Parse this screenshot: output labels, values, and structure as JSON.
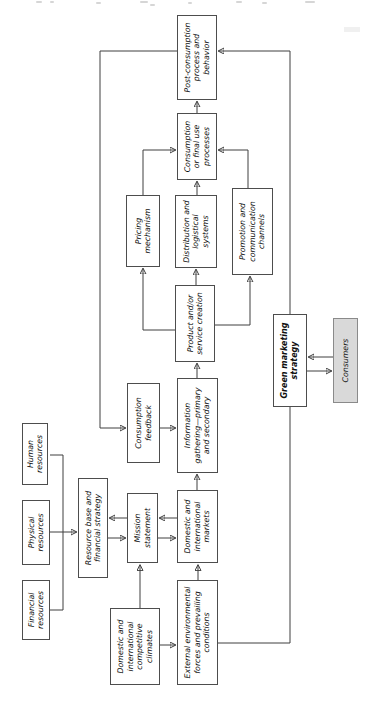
{
  "diagram": {
    "title_note": "",
    "colors": {
      "box_border": "#4d4d4d",
      "line": "#3f3f3f",
      "text": "#101010",
      "consumers_fill": "#d9d9d9",
      "background": "#ffffff"
    },
    "nodes": {
      "financial_resources": {
        "label": "Financial resources"
      },
      "physical_resources": {
        "label": "Physical resources"
      },
      "human_resources": {
        "label": "Human resources"
      },
      "resource_base": {
        "label": "Resource base and financial strategy"
      },
      "competitive_climates": {
        "label": "Domestic and international competitive climates"
      },
      "mission_statement": {
        "label": "Mission statement"
      },
      "consumption_feedback": {
        "label": "Consumption feedback"
      },
      "pricing_mechanism": {
        "label": "Pricing mechanism"
      },
      "external_environment": {
        "label": "External environmental forces and prevailing conditions"
      },
      "markets": {
        "label": "Domestic and international markets"
      },
      "information_gathering": {
        "label": "Information gathering—primary and secondary"
      },
      "product_creation": {
        "label": "Product and/or service creation"
      },
      "distribution": {
        "label": "Distribution and logistical systems"
      },
      "consumption": {
        "label": "Consumption or final use processes"
      },
      "post_consumption": {
        "label": "Post-consumption process and behavior"
      },
      "promotion": {
        "label": "Promotion and communication channels"
      },
      "green_marketing_strategy": {
        "label": "Green marketing strategy",
        "emphasis": "bold"
      },
      "consumers": {
        "label": "Consumers",
        "fill": "#d9d9d9"
      }
    },
    "edges": [
      {
        "from": "financial_resources",
        "to": "resource_base"
      },
      {
        "from": "physical_resources",
        "to": "resource_base"
      },
      {
        "from": "human_resources",
        "to": "resource_base"
      },
      {
        "from": "resource_base",
        "to": "mission_statement",
        "bidirectional": true
      },
      {
        "from": "mission_statement",
        "to": "markets",
        "bidirectional": true
      },
      {
        "from": "competitive_climates",
        "to": "mission_statement"
      },
      {
        "from": "competitive_climates",
        "to": "external_environment"
      },
      {
        "from": "external_environment",
        "to": "markets"
      },
      {
        "from": "markets",
        "to": "information_gathering"
      },
      {
        "from": "information_gathering",
        "to": "product_creation"
      },
      {
        "from": "product_creation",
        "to": "pricing_mechanism"
      },
      {
        "from": "product_creation",
        "to": "distribution"
      },
      {
        "from": "product_creation",
        "to": "promotion"
      },
      {
        "from": "pricing_mechanism",
        "to": "consumption"
      },
      {
        "from": "distribution",
        "to": "consumption"
      },
      {
        "from": "promotion",
        "to": "consumption"
      },
      {
        "from": "consumption",
        "to": "post_consumption"
      },
      {
        "from": "post_consumption",
        "to": "consumption_feedback"
      },
      {
        "from": "consumption_feedback",
        "to": "information_gathering"
      },
      {
        "from": "external_environment",
        "to": "green_marketing_strategy"
      },
      {
        "from": "green_marketing_strategy",
        "to": "post_consumption"
      },
      {
        "from": "green_marketing_strategy",
        "to": "consumers",
        "bidirectional": true
      }
    ]
  }
}
